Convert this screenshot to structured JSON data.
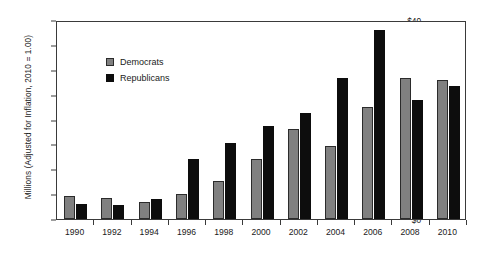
{
  "chart_data": {
    "type": "bar",
    "title": "",
    "subtitle": "",
    "xlabel": "",
    "ylabel": "Millions (Adjusted for Inflation, 2010 = 1.00)",
    "ylim": [
      0,
      40
    ],
    "ytick_step": 5,
    "ytick_labels": [
      "$0",
      "$5",
      "$10",
      "$15",
      "$20",
      "$25",
      "$30",
      "$35",
      "$40"
    ],
    "ytick_values": [
      0,
      5,
      10,
      15,
      20,
      25,
      30,
      35,
      40
    ],
    "grid": false,
    "legend_position": "upper-left-inside",
    "categories": [
      "1990",
      "1992",
      "1994",
      "1996",
      "1998",
      "2000",
      "2002",
      "2004",
      "2006",
      "2008",
      "2010"
    ],
    "series": [
      {
        "name": "Democrats",
        "color": "#808080",
        "values": [
          4.7,
          4.3,
          3.4,
          5.0,
          7.7,
          12.0,
          18.1,
          14.6,
          22.6,
          28.3,
          28.0
        ]
      },
      {
        "name": "Republicans",
        "color": "#0d0d0d",
        "values": [
          3.0,
          2.9,
          4.0,
          12.0,
          15.3,
          18.6,
          21.4,
          28.4,
          38.0,
          24.0,
          26.8
        ]
      }
    ]
  },
  "legend": {
    "items": [
      {
        "label": "Democrats",
        "swatch": "gray-square-icon"
      },
      {
        "label": "Republicans",
        "swatch": "black-square-icon"
      }
    ]
  }
}
